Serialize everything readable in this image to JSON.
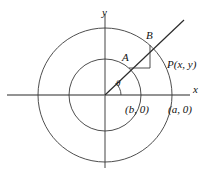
{
  "figure": {
    "kind": "geometry-diagram",
    "colors": {
      "stroke": "#3a3a3a",
      "axis": "#6f6f6f",
      "text": "#111111",
      "background": "#ffffff"
    },
    "labels": {
      "x_axis": "x",
      "y_axis": "y",
      "inner_point": "A",
      "outer_point": "B",
      "ray_point": "P(x, y)",
      "angle": "θ",
      "inner_radius_point": "(b, 0)",
      "outer_radius_point": "(a, 0)"
    },
    "geometry": {
      "origin": {
        "x": 105,
        "y": 95
      },
      "outer_circle_radius": 67,
      "inner_circle_radius": 36,
      "ray_angle_degrees": 48,
      "point_A": {
        "x": 129,
        "y": 68
      },
      "point_B": {
        "x": 150,
        "y": 45
      },
      "right_angle_corner": {
        "x": 150,
        "y": 68
      },
      "ray_end": {
        "x": 184,
        "y": 20
      },
      "x_axis_span": {
        "from": 7,
        "to": 190
      },
      "y_axis_span": {
        "from": 14,
        "to": 168
      },
      "theta_arc_radius": 16
    }
  }
}
